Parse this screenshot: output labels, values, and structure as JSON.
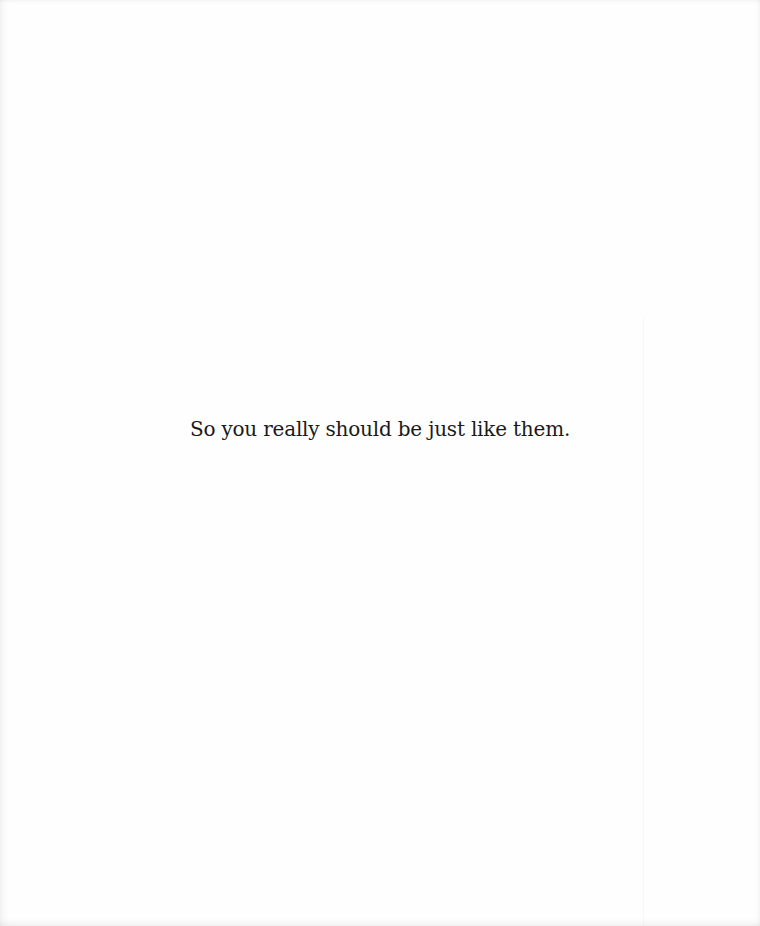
{
  "page": {
    "text_lines": [
      "So you really should be just like them."
    ],
    "colors": {
      "background": "#fefefe",
      "text": "#1a1a1a"
    }
  }
}
